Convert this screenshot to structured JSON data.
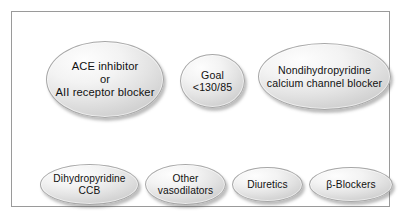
{
  "figure": {
    "kind": "medical-treatment-flow-diagram",
    "frame": {
      "border_color": "#9a9a9a",
      "background_color": "#ffffff"
    },
    "node_style": {
      "shape": "ellipse",
      "fill_light": "#fdfdfd",
      "fill_mid": "#e3e3e3",
      "fill_dark": "#cfcfcf",
      "border_color": "#a7a7a7",
      "text_color": "#111111",
      "shadow_color": "#5a5a5a"
    },
    "top_row": [
      {
        "id": "ace-inhibitor",
        "label": "ACE inhibitor\nor\nAII receptor blocker"
      },
      {
        "id": "goal",
        "label": "Goal\n<130/85"
      },
      {
        "id": "nondihydropyridine-ccb",
        "label": "Nondihydropyridine\ncalcium channel blocker"
      }
    ],
    "bottom_row": [
      {
        "id": "dihydropyridine-ccb",
        "label": "Dihydropyridine\nCCB"
      },
      {
        "id": "other-vasodilators",
        "label": "Other\nvasodilators"
      },
      {
        "id": "diuretics",
        "label": "Diuretics"
      },
      {
        "id": "beta-blockers",
        "label": "β-Blockers"
      }
    ]
  }
}
